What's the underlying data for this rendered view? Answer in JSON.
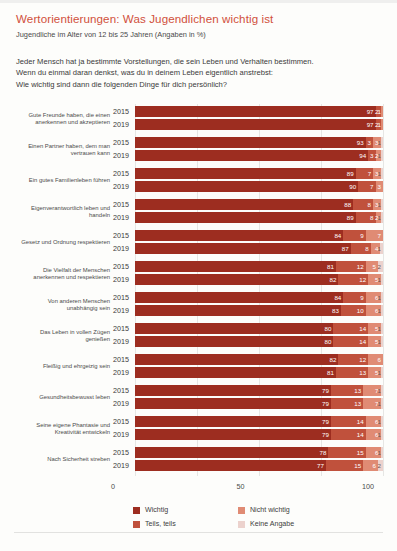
{
  "header": {
    "title": "Wertorientierungen: Was Jugendlichen wichtig ist",
    "subtitle": "Jugendliche im Alter von 12 bis 25 Jahren (Angaben in %)",
    "question_line1": "Jeder Mensch hat ja bestimmte Vorstellungen, die sein Leben und Verhalten bestimmen.",
    "question_line2": "Wenn du einmal daran denkst, was du in deinem Leben eigentlich anstrebst:",
    "question_line3": "Wie wichtig sind dann die folgenden Dinge für dich persönlich?"
  },
  "colors": {
    "title": "#d1503c",
    "wichtig": "#9d2d20",
    "teils_teils": "#c0513c",
    "nicht_wichtig": "#e08b74",
    "keine_angabe": "#ecd2cd"
  },
  "chart_data": {
    "type": "bar",
    "orientation": "horizontal",
    "stacked": true,
    "title": "Wertorientierungen: Was Jugendlichen wichtig ist",
    "subtitle": "Jugendliche im Alter von 12 bis 25 Jahren (Angaben in %)",
    "xlabel": "",
    "ylabel": "",
    "xlim": [
      0,
      100
    ],
    "xticks": [
      "0",
      "50",
      "100"
    ],
    "grid": true,
    "legend_position": "bottom",
    "series": [
      {
        "name": "Wichtig",
        "color": "#9d2d20"
      },
      {
        "name": "Teils, teils",
        "color": "#c0513c"
      },
      {
        "name": "Nicht wichtig",
        "color": "#e08b74"
      },
      {
        "name": "Keine Angabe",
        "color": "#ecd2cd"
      }
    ],
    "years": [
      "2015",
      "2019"
    ],
    "groups": [
      {
        "label_line1": "Gute Freunde haben, die einen",
        "label_line2": "anerkennen und akzeptieren",
        "rows": [
          {
            "year": "2015",
            "values": [
              97,
              2,
              1,
              0
            ]
          },
          {
            "year": "2019",
            "values": [
              97,
              2,
              1,
              0
            ]
          }
        ]
      },
      {
        "label_line1": "Einen Partner haben, dem man",
        "label_line2": "vertrauen kann",
        "rows": [
          {
            "year": "2015",
            "values": [
              93,
              3,
              3,
              1
            ]
          },
          {
            "year": "2019",
            "values": [
              94,
              3,
              2,
              1
            ]
          }
        ]
      },
      {
        "label_line1": "Ein gutes Familienleben führen",
        "label_line2": "",
        "rows": [
          {
            "year": "2015",
            "values": [
              89,
              7,
              3,
              1
            ]
          },
          {
            "year": "2019",
            "values": [
              90,
              7,
              3,
              0
            ]
          }
        ]
      },
      {
        "label_line1": "Eigenverantwortlich leben und",
        "label_line2": "handeln",
        "rows": [
          {
            "year": "2015",
            "values": [
              88,
              8,
              3,
              1
            ]
          },
          {
            "year": "2019",
            "values": [
              89,
              8,
              2,
              1
            ]
          }
        ]
      },
      {
        "label_line1": "Gesetz und Ordnung respektieren",
        "label_line2": "",
        "rows": [
          {
            "year": "2015",
            "values": [
              84,
              9,
              7,
              0
            ]
          },
          {
            "year": "2019",
            "values": [
              87,
              8,
              4,
              1
            ]
          }
        ]
      },
      {
        "label_line1": "Die Vielfalt der Menschen",
        "label_line2": "anerkennen und respektieren",
        "rows": [
          {
            "year": "2015",
            "values": [
              81,
              12,
              5,
              2
            ]
          },
          {
            "year": "2019",
            "values": [
              82,
              12,
              5,
              1
            ]
          }
        ]
      },
      {
        "label_line1": "Von anderen Menschen",
        "label_line2": "unabhängig sein",
        "rows": [
          {
            "year": "2015",
            "values": [
              84,
              9,
              6,
              1
            ]
          },
          {
            "year": "2019",
            "values": [
              83,
              10,
              6,
              1
            ]
          }
        ]
      },
      {
        "label_line1": "Das Leben in vollen Zügen",
        "label_line2": "genießen",
        "rows": [
          {
            "year": "2015",
            "values": [
              80,
              14,
              5,
              1
            ]
          },
          {
            "year": "2019",
            "values": [
              80,
              14,
              5,
              1
            ]
          }
        ]
      },
      {
        "label_line1": "Fleißig und ehrgeizig sein",
        "label_line2": "",
        "rows": [
          {
            "year": "2015",
            "values": [
              82,
              12,
              6,
              0
            ]
          },
          {
            "year": "2019",
            "values": [
              81,
              13,
              5,
              1
            ]
          }
        ]
      },
      {
        "label_line1": "Gesundheitsbewusst leben",
        "label_line2": "",
        "rows": [
          {
            "year": "2015",
            "values": [
              79,
              13,
              7,
              1
            ]
          },
          {
            "year": "2019",
            "values": [
              79,
              13,
              7,
              1
            ]
          }
        ]
      },
      {
        "label_line1": "Seine eigene Phantasie und",
        "label_line2": "Kreativität entwickeln",
        "rows": [
          {
            "year": "2015",
            "values": [
              79,
              14,
              6,
              1
            ]
          },
          {
            "year": "2019",
            "values": [
              79,
              14,
              6,
              1
            ]
          }
        ]
      },
      {
        "label_line1": "Nach Sicherheit streben",
        "label_line2": "",
        "rows": [
          {
            "year": "2015",
            "values": [
              78,
              15,
              6,
              1
            ]
          },
          {
            "year": "2019",
            "values": [
              77,
              15,
              6,
              2
            ]
          }
        ]
      }
    ]
  },
  "axis": {
    "ticks": [
      "0",
      "50",
      "100"
    ]
  },
  "legend": {
    "items": [
      {
        "label": "Wichtig",
        "color": "#9d2d20"
      },
      {
        "label": "Nicht wichtig",
        "color": "#e08b74"
      },
      {
        "label": "Teils, teils",
        "color": "#c0513c"
      },
      {
        "label": "Keine Angabe",
        "color": "#ecd2cd"
      }
    ]
  }
}
